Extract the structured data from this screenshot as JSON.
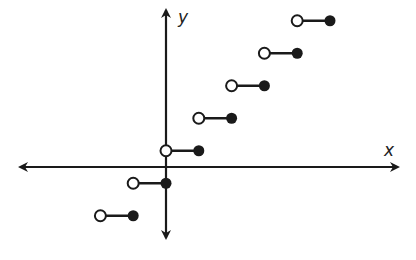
{
  "chart_data": {
    "type": "scatter",
    "subtype": "step-function",
    "title": "",
    "xlabel": "x",
    "ylabel": "y",
    "grid": false,
    "legend": null,
    "xlim": [
      -4.5,
      7
    ],
    "ylim": [
      -2.2,
      4.9
    ],
    "axis_arrows": true,
    "tick_labels": [],
    "segments": [
      {
        "x_start": -2,
        "x_end": -1,
        "y": -1.5,
        "open_left": true,
        "closed_right": true
      },
      {
        "x_start": -1,
        "x_end": 0,
        "y": -0.5,
        "open_left": true,
        "closed_right": true
      },
      {
        "x_start": 0,
        "x_end": 1,
        "y": 0.5,
        "open_left": true,
        "closed_right": true
      },
      {
        "x_start": 1,
        "x_end": 2,
        "y": 1.5,
        "open_left": true,
        "closed_right": true
      },
      {
        "x_start": 2,
        "x_end": 3,
        "y": 2.5,
        "open_left": true,
        "closed_right": true
      },
      {
        "x_start": 3,
        "x_end": 4,
        "y": 3.5,
        "open_left": true,
        "closed_right": true
      },
      {
        "x_start": 4,
        "x_end": 5,
        "y": 4.5,
        "open_left": true,
        "closed_right": true
      }
    ],
    "annotations": [
      "open circle = endpoint excluded",
      "filled circle = endpoint included"
    ]
  },
  "render": {
    "origin_px": [
      166,
      167
    ],
    "unit_x_px": 32.8,
    "unit_y_px": 32.5,
    "stroke_color": "#1a1a1a",
    "point_radius": 5.5
  }
}
